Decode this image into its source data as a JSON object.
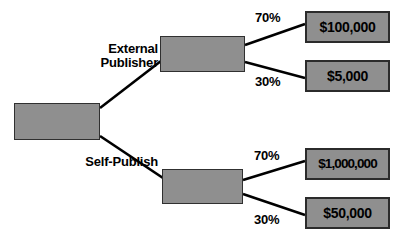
{
  "diagram": {
    "type": "decision-tree",
    "title": "",
    "colors": {
      "node_fill": "#8f8f8f",
      "node_border": "#2b2b2b",
      "edge": "#000000",
      "text": "#000000",
      "background": "#ffffff"
    },
    "root": {
      "label": ""
    },
    "decisions": [
      {
        "id": "external-publisher",
        "label": "External\nPublisher"
      },
      {
        "id": "self-publish",
        "label": "Self-Publish"
      }
    ],
    "chance_nodes": [
      {
        "id": "chance-external",
        "label": ""
      },
      {
        "id": "chance-self",
        "label": ""
      }
    ],
    "branches": [
      {
        "id": "external-high",
        "probability": "70%",
        "outcome": "$100,000"
      },
      {
        "id": "external-low",
        "probability": "30%",
        "outcome": "$5,000"
      },
      {
        "id": "self-high",
        "probability": "70%",
        "outcome": "$1,000,000"
      },
      {
        "id": "self-low",
        "probability": "30%",
        "outcome": "$50,000"
      }
    ],
    "outcomes": [
      {
        "id": "outcome-100k",
        "value": "$100,000"
      },
      {
        "id": "outcome-5k",
        "value": "$5,000"
      },
      {
        "id": "outcome-1m",
        "value": "$1,000,000"
      },
      {
        "id": "outcome-50k",
        "value": "$50,000"
      }
    ]
  }
}
